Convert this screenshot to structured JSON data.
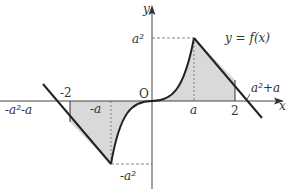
{
  "figure": {
    "function_label": "y = f(x)",
    "axis_labels": {
      "x": "x",
      "y": "y",
      "origin": "O"
    },
    "x_ticks": [
      {
        "label": "-a²-a",
        "role": "left-zero"
      },
      {
        "label": "-2",
        "role": "left-bound"
      },
      {
        "label": "-a",
        "role": "trough-x"
      },
      {
        "label": "a",
        "role": "peak-x"
      },
      {
        "label": "2",
        "role": "right-bound"
      },
      {
        "label": "a²+a",
        "role": "right-zero"
      }
    ],
    "y_ticks": [
      {
        "label": "a²",
        "role": "peak-y"
      },
      {
        "label": "-a²",
        "role": "trough-y"
      }
    ],
    "shaded_regions": [
      {
        "from": "-2",
        "to": "0",
        "note": "between curve and x-axis, left side"
      },
      {
        "from": "0",
        "to": "2",
        "note": "between curve and x-axis, right side"
      }
    ],
    "colors": {
      "curve": "#222222",
      "shade": "#d9d9d9",
      "axis": "#444444",
      "dash": "#666666"
    }
  }
}
